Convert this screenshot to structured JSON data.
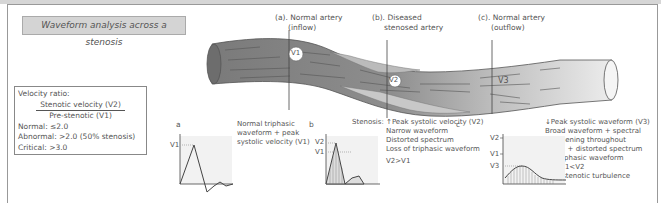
{
  "title": "Waveform analysis across a stenosis",
  "sections": {
    "a": {
      "heading": "(a). Normal artery",
      "sub": "(inflow)"
    },
    "b": {
      "heading": "(b). Diseased",
      "sub": "stenosed artery"
    },
    "c": {
      "heading": "(c). Normal artery",
      "sub": "(outflow)"
    }
  },
  "velocity_markers": [
    "V1",
    "V2",
    "V3"
  ],
  "ratio_box": {
    "title": "Velocity ratio:",
    "numerator": "Stenotic velocity (V2)",
    "denominator": "Pre-stenotic (V1)",
    "normal": "Normal: ≤2.0",
    "abnormal": "Abnormal: >2.0 (50% stenosis)",
    "critical": "Critical: >3.0"
  },
  "panels": {
    "a": {
      "letter": "a",
      "description": [
        "Normal triphasic",
        "waveform + peak",
        "systolic velocity (V1)"
      ],
      "axis_labels": [
        "V1"
      ]
    },
    "b": {
      "letter": "b",
      "description": [
        "Stenosis: ↑Peak systolic velocity (V2)",
        "Narrow waveform",
        "Distorted spectrum",
        "Loss of triphasic waveform",
        "V2>V1"
      ],
      "axis_labels": [
        "V2",
        "V1"
      ]
    },
    "c": {
      "letter": "c",
      "description": [
        "↓Peak systolic waveform (V3)",
        "Broad waveform + spectral",
        "broadening throughout",
        "cycle, + distorted spectrum",
        "Monophasic waveform",
        "V3<V1<V2",
        "Post-stenotic turbulence"
      ],
      "axis_labels": [
        "V2",
        "V1",
        "V3"
      ]
    }
  }
}
